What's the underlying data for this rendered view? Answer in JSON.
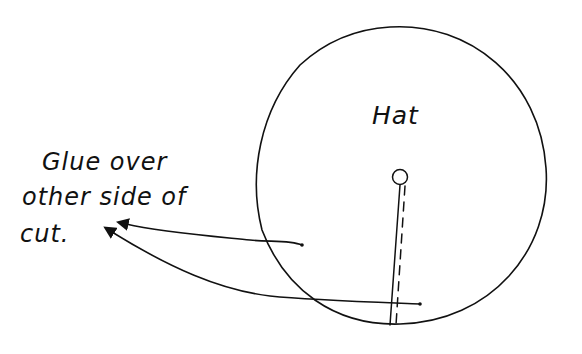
{
  "diagram": {
    "hat_label": "Hat",
    "note_lines": [
      "Glue over",
      "other side of",
      "cut."
    ],
    "colors": {
      "ink": "#111111",
      "background": "#ffffff"
    },
    "shapes": {
      "hat_circle": {
        "cx": 401,
        "cy": 175,
        "r": 146
      },
      "center_hole": {
        "cx": 400,
        "cy": 177,
        "r": 8
      },
      "cut_line": "solid line from center hole to rim",
      "fold_line": "dashed line parallel to cut"
    },
    "arrows": [
      {
        "name": "arrow-from-inside-circle",
        "from": [
          302,
          245
        ],
        "to": [
          122,
          222
        ]
      },
      {
        "name": "arrow-from-bottom-cut",
        "from": [
          420,
          304
        ],
        "to": [
          108,
          229
        ]
      }
    ]
  }
}
